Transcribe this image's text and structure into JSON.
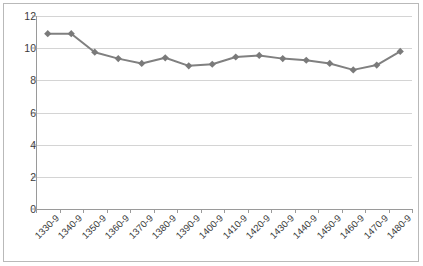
{
  "chart_data": {
    "type": "line",
    "title": "",
    "subtitle": "",
    "xlabel": "",
    "ylabel": "",
    "categories": [
      "1330-9",
      "1340-9",
      "1350-9",
      "1360-9",
      "1370-9",
      "1380-9",
      "1390-9",
      "1400-9",
      "1410-9",
      "1420-9",
      "1430-9",
      "1440-9",
      "1450-9",
      "1460-9",
      "1470-9",
      "1480-9"
    ],
    "values": [
      10.9,
      10.9,
      9.75,
      9.35,
      9.05,
      9.4,
      8.9,
      9.0,
      9.45,
      9.55,
      9.35,
      9.25,
      9.05,
      8.65,
      8.95,
      9.8
    ],
    "series": [
      {
        "name": "Series 1",
        "values": [
          10.9,
          10.9,
          9.75,
          9.35,
          9.05,
          9.4,
          8.9,
          9.0,
          9.45,
          9.55,
          9.35,
          9.25,
          9.05,
          8.65,
          8.95,
          9.8
        ]
      }
    ],
    "ylim": [
      0,
      12
    ],
    "ytick_labels": [
      "0",
      "2",
      "4",
      "6",
      "8",
      "10",
      "12"
    ],
    "ytick_values": [
      0,
      2,
      4,
      6,
      8,
      10,
      12
    ],
    "grid": true,
    "grid_axis": "y",
    "legend": false,
    "legend_position": "none",
    "marker": "diamond",
    "annotations": []
  },
  "style": {
    "series_color": "#808080",
    "marker_color": "#7a7a7a",
    "grid_color": "#d4d4d4",
    "axis_color": "#9a9a9a",
    "text_color": "#3a3a3a",
    "border_color": "#b9b9b9",
    "background": "#ffffff"
  }
}
